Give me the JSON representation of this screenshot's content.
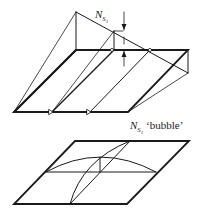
{
  "figure": {
    "top_panel": {
      "label_symbol": "N",
      "label_sub": "S",
      "label_subsub": "1",
      "description": "slab with yield-line prism deflection"
    },
    "bottom_panel": {
      "label_symbol": "N",
      "label_sub": "S",
      "label_subsub": "1",
      "label_suffix": " ‘bubble’",
      "description": "bubble deflection shape"
    },
    "colors": {
      "line": "#1a1a1a",
      "background": "#ffffff"
    }
  }
}
